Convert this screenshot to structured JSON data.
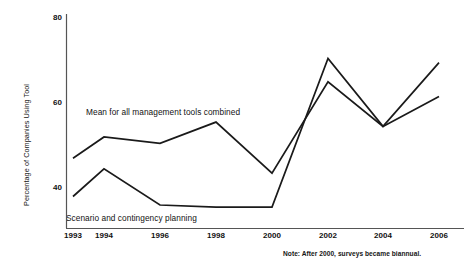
{
  "chart_data": {
    "type": "line",
    "title": "",
    "xlabel": "",
    "ylabel": "Percentage of Companies Using Tool",
    "categories": [
      "1993",
      "1994",
      "1996",
      "1998",
      "2000",
      "2002",
      "2004",
      "2006"
    ],
    "x": [
      1993,
      1994,
      1996,
      1998,
      2000,
      2002,
      2004,
      2006
    ],
    "xlim": [
      1993,
      2006
    ],
    "ylim": [
      35,
      80
    ],
    "yticks": [
      40,
      60,
      80
    ],
    "ytick_labels": [
      "40",
      "60",
      "80"
    ],
    "grid": false,
    "legend_position": "inline-annotations",
    "series": [
      {
        "name": "Mean for all management tools combined",
        "values": [
          47,
          52,
          50.5,
          55.5,
          43.5,
          65,
          54.5,
          61.5
        ]
      },
      {
        "name": "Scenario and contingency planning",
        "values": [
          38,
          44.5,
          36,
          35.5,
          35.5,
          70.5,
          54.5,
          69.5
        ]
      }
    ],
    "annotations": [
      {
        "id": "series-label-mean",
        "text": "Mean for all management tools combined"
      },
      {
        "id": "series-label-scenario",
        "text": "Scenario and contingency planning"
      },
      {
        "id": "footnote",
        "text": "Note: After 2000, surveys became biannual."
      }
    ],
    "colors": {
      "line": "#1a1a1a",
      "axis": "#4a4a4a",
      "background": "#ffffff",
      "text": "#111111"
    }
  }
}
